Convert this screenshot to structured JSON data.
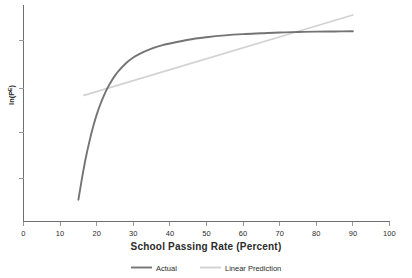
{
  "chart_data": {
    "type": "line",
    "title": "",
    "subtitle": "",
    "xlabel": "School Passing Rate (Percent)",
    "ylabel": "ln(Pᴱ)",
    "xlim": [
      0,
      100
    ],
    "ylim": [
      0,
      10
    ],
    "grid": false,
    "legend_position": "bottom-center",
    "x_ticks": [
      0,
      10,
      20,
      30,
      40,
      50,
      60,
      70,
      80,
      90,
      100
    ],
    "x_tick_labels": [
      "0",
      "10",
      "20",
      "30",
      "40",
      "50",
      "60",
      "70",
      "80",
      "90",
      "100"
    ],
    "y_ticks": [
      2.1,
      4.4,
      6.3,
      8.4
    ],
    "y_tick_labels": [
      "",
      "",
      "",
      ""
    ],
    "series": [
      {
        "name": "Actual",
        "color": "#747474",
        "x": [
          15,
          16,
          17,
          18,
          19,
          20,
          21,
          22,
          23,
          24,
          25,
          26,
          28,
          30,
          32,
          35,
          38,
          40,
          45,
          50,
          55,
          60,
          65,
          70,
          75,
          80,
          85,
          90
        ],
        "y": [
          1.05,
          2.1,
          3.05,
          3.85,
          4.55,
          5.15,
          5.65,
          6.08,
          6.45,
          6.76,
          7.03,
          7.26,
          7.63,
          7.9,
          8.1,
          8.33,
          8.5,
          8.58,
          8.76,
          8.88,
          8.97,
          9.03,
          9.07,
          9.11,
          9.13,
          9.15,
          9.16,
          9.17
        ]
      },
      {
        "name": "Linear Prediction",
        "color": "#d2d2d2",
        "x": [
          16.5,
          90
        ],
        "y": [
          6.08,
          9.95
        ]
      }
    ],
    "legend": [
      {
        "label": "Actual",
        "color": "#747474"
      },
      {
        "label": "Linear Prediction",
        "color": "#d2d2d2"
      }
    ]
  },
  "axes": {
    "x_axis_name": "x-axis",
    "y_axis_name": "y-axis"
  }
}
